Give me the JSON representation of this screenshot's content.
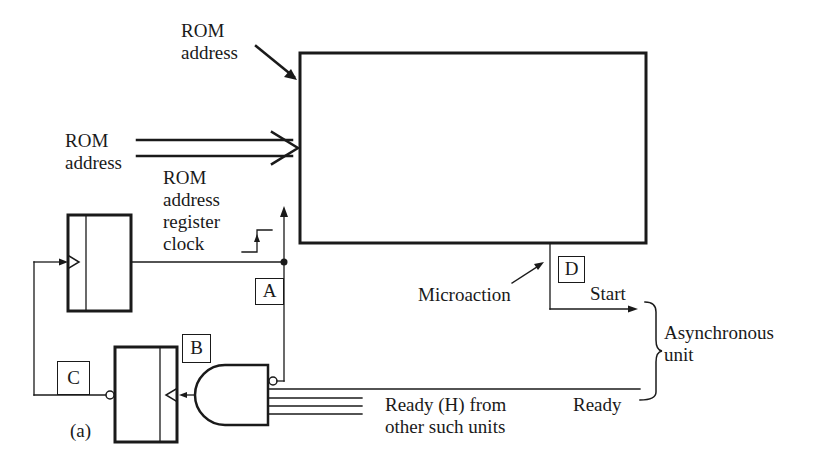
{
  "diagram": {
    "figure_label": "(a)",
    "labels": {
      "rom_address_top_line1": "ROM",
      "rom_address_top_line2": "address",
      "rom_address_left_line1": "ROM",
      "rom_address_left_line2": "address",
      "rom_address_register_clock_line1": "ROM",
      "rom_address_register_clock_line2": "address",
      "rom_address_register_clock_line3": "register",
      "rom_address_register_clock_line4": "clock",
      "microaction": "Microaction",
      "start": "Start",
      "asynchronous_unit_line1": "Asynchronous",
      "asynchronous_unit_line2": "unit",
      "ready": "Ready",
      "ready_h_line1": "Ready (H) from",
      "ready_h_line2": "other such units"
    },
    "test_points": {
      "a": "A",
      "b": "B",
      "c": "C",
      "d": "D"
    },
    "components": {
      "rom": "ROM block",
      "address_register": "ROM address register",
      "sync_flipflop": "flip-flop",
      "and_gate": "AND gate (Ready inputs)"
    }
  }
}
